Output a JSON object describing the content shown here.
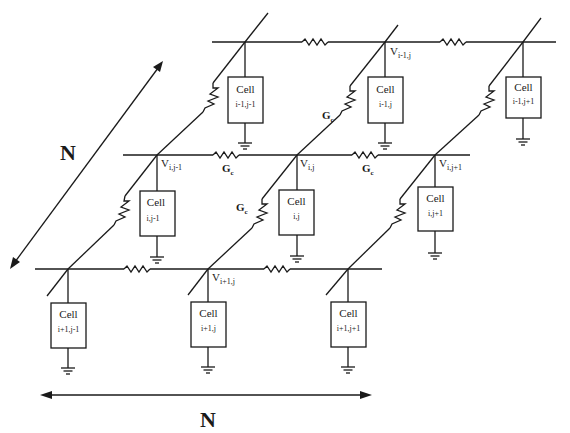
{
  "diagram": {
    "type": "2D resistive grid of cells",
    "size_label": "N",
    "arrows": {
      "horizontal_label": "N",
      "diagonal_label": "N"
    },
    "conductance_label": {
      "main": "G",
      "sub": "c"
    },
    "node_voltage_symbol": "V",
    "cell_title": "Cell",
    "rows": [
      {
        "name": "row i-1",
        "nodes": [
          {
            "voltage_sub": "",
            "cell_index": "i-1,j-1"
          },
          {
            "voltage_sub": "i-1,j",
            "cell_index": "i-1,j"
          },
          {
            "voltage_sub": "",
            "cell_index": "i-1,j+1"
          }
        ]
      },
      {
        "name": "row i",
        "nodes": [
          {
            "voltage_sub": "i,j-1",
            "cell_index": "i,j-1"
          },
          {
            "voltage_sub": "i,j",
            "cell_index": "i,j"
          },
          {
            "voltage_sub": "i,j+1",
            "cell_index": "i,j+1"
          }
        ]
      },
      {
        "name": "row i+1",
        "nodes": [
          {
            "voltage_sub": "",
            "cell_index": "i+1,j-1"
          },
          {
            "voltage_sub": "i+1,j",
            "cell_index": "i+1,j"
          },
          {
            "voltage_sub": "",
            "cell_index": "i+1,j+1"
          }
        ]
      }
    ],
    "colors": {
      "ink": "#1a1a1a",
      "background": "#ffffff"
    }
  }
}
